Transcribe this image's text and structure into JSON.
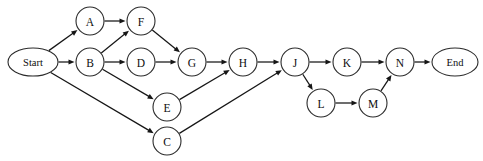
{
  "diagram": {
    "type": "flowchart-dag",
    "canvas": {
      "width": 483,
      "height": 161,
      "background": "#ffffff"
    },
    "style": {
      "edge_color": "#161616",
      "node_stroke": "#2b2b2b",
      "node_fill": "#ffffff",
      "label_color": "#0d0d0d"
    },
    "nodes": [
      {
        "id": "start",
        "label": "Start",
        "shape": "ellipse",
        "cx": 33,
        "cy": 62,
        "rx": 25,
        "ry": 14
      },
      {
        "id": "A",
        "label": "A",
        "shape": "circle",
        "cx": 90,
        "cy": 21,
        "rx": 14,
        "ry": 14
      },
      {
        "id": "B",
        "label": "B",
        "shape": "circle",
        "cx": 90,
        "cy": 62,
        "rx": 14,
        "ry": 14
      },
      {
        "id": "F",
        "label": "F",
        "shape": "circle",
        "cx": 141,
        "cy": 21,
        "rx": 14,
        "ry": 14
      },
      {
        "id": "D",
        "label": "D",
        "shape": "circle",
        "cx": 141,
        "cy": 62,
        "rx": 14,
        "ry": 14
      },
      {
        "id": "G",
        "label": "G",
        "shape": "circle",
        "cx": 192,
        "cy": 62,
        "rx": 14,
        "ry": 14
      },
      {
        "id": "E",
        "label": "E",
        "shape": "circle",
        "cx": 167,
        "cy": 107,
        "rx": 14,
        "ry": 14
      },
      {
        "id": "C",
        "label": "C",
        "shape": "circle",
        "cx": 167,
        "cy": 141,
        "rx": 14,
        "ry": 14
      },
      {
        "id": "H",
        "label": "H",
        "shape": "circle",
        "cx": 243,
        "cy": 62,
        "rx": 14,
        "ry": 14
      },
      {
        "id": "J",
        "label": "J",
        "shape": "circle",
        "cx": 295,
        "cy": 62,
        "rx": 14,
        "ry": 14
      },
      {
        "id": "K",
        "label": "K",
        "shape": "circle",
        "cx": 347,
        "cy": 62,
        "rx": 14,
        "ry": 14
      },
      {
        "id": "L",
        "label": "L",
        "shape": "circle",
        "cx": 321,
        "cy": 103,
        "rx": 14,
        "ry": 14
      },
      {
        "id": "M",
        "label": "M",
        "shape": "circle",
        "cx": 373,
        "cy": 103,
        "rx": 14,
        "ry": 14
      },
      {
        "id": "N",
        "label": "N",
        "shape": "circle",
        "cx": 400,
        "cy": 62,
        "rx": 14,
        "ry": 14
      },
      {
        "id": "end",
        "label": "End",
        "shape": "ellipse",
        "cx": 455,
        "cy": 62,
        "rx": 23,
        "ry": 14
      }
    ],
    "edges": [
      {
        "from": "start",
        "to": "A"
      },
      {
        "from": "start",
        "to": "B"
      },
      {
        "from": "start",
        "to": "C"
      },
      {
        "from": "A",
        "to": "F"
      },
      {
        "from": "B",
        "to": "F"
      },
      {
        "from": "B",
        "to": "D"
      },
      {
        "from": "B",
        "to": "E"
      },
      {
        "from": "D",
        "to": "G"
      },
      {
        "from": "F",
        "to": "G"
      },
      {
        "from": "G",
        "to": "H"
      },
      {
        "from": "E",
        "to": "H"
      },
      {
        "from": "H",
        "to": "J"
      },
      {
        "from": "C",
        "to": "J"
      },
      {
        "from": "J",
        "to": "K"
      },
      {
        "from": "J",
        "to": "L"
      },
      {
        "from": "K",
        "to": "N"
      },
      {
        "from": "L",
        "to": "M"
      },
      {
        "from": "M",
        "to": "N"
      },
      {
        "from": "N",
        "to": "end"
      }
    ]
  }
}
